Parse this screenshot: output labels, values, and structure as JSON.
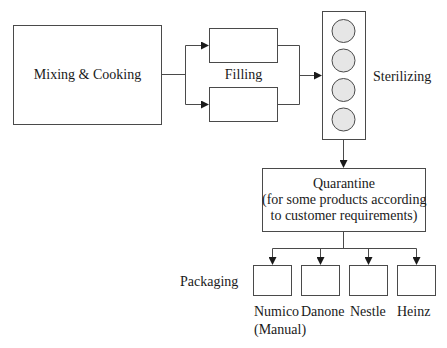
{
  "diagram": {
    "type": "process-flow",
    "stages": {
      "mixing": {
        "label": "Mixing & Cooking"
      },
      "filling": {
        "label": "Filling",
        "units": 2
      },
      "sterilizing": {
        "label": "Sterilizing",
        "vessels": 4
      },
      "quarantine": {
        "line1": "Quarantine",
        "line2": "(for some products according",
        "line3": "to customer requirements)"
      },
      "packaging": {
        "label": "Packaging",
        "lines": [
          {
            "name": "Numico",
            "note": "(Manual)"
          },
          {
            "name": "Danone",
            "note": ""
          },
          {
            "name": "Nestle",
            "note": ""
          },
          {
            "name": "Heinz",
            "note": ""
          }
        ]
      }
    },
    "colors": {
      "stroke": "#4a4a4a",
      "circle_fill": "#e6e6e6",
      "background": "#ffffff"
    }
  }
}
